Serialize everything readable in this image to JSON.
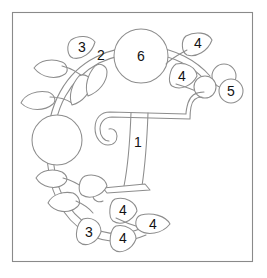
{
  "figure": {
    "background_color": "#ffffff",
    "line_color": "#8d8d8d",
    "label_color": "#121212",
    "frame": {
      "name": "diagram-border",
      "x": 12,
      "y": 12,
      "width": 241,
      "height": 250,
      "stroke_color": "#8a8a8a"
    },
    "callouts": [
      {
        "id": "callout-1",
        "label": "1",
        "x": 138,
        "y": 143,
        "target": "central-scroll-stem"
      },
      {
        "id": "callout-2",
        "label": "2",
        "x": 101,
        "y": 56,
        "target": "upper-vine-stem"
      },
      {
        "id": "callout-3-top",
        "label": "3",
        "x": 82,
        "y": 52,
        "target": "upper-left-leaf"
      },
      {
        "id": "callout-4-top-right",
        "label": "4",
        "x": 198,
        "y": 47,
        "target": "upper-right-leaf"
      },
      {
        "id": "callout-4-mid-right",
        "label": "4",
        "x": 181,
        "y": 78,
        "target": "right-leaf"
      },
      {
        "id": "callout-5",
        "label": "5",
        "x": 231,
        "y": 91,
        "target": "berry"
      },
      {
        "id": "callout-6",
        "label": "6",
        "x": 141,
        "y": 56,
        "target": "large-flower-head"
      },
      {
        "id": "callout-4-bottom-upper",
        "label": "4",
        "x": 124,
        "y": 212,
        "target": "lower-leaf-upper"
      },
      {
        "id": "callout-4-bottom-right",
        "label": "4",
        "x": 153,
        "y": 226,
        "target": "lower-leaf-right"
      },
      {
        "id": "callout-4-bottom-lower",
        "label": "4",
        "x": 124,
        "y": 239,
        "target": "lower-leaf-lower"
      },
      {
        "id": "callout-3-bottom",
        "label": "3",
        "x": 89,
        "y": 234,
        "target": "lower-left-leaf"
      }
    ],
    "parts": [
      {
        "name": "large-flower-head",
        "shape": "circle",
        "cx": 141,
        "cy": 56,
        "r": 27
      },
      {
        "name": "left-flower-head",
        "shape": "circle",
        "cx": 57,
        "cy": 140,
        "r": 25
      },
      {
        "name": "berry-upper",
        "shape": "circle",
        "cx": 224,
        "cy": 76,
        "r": 12
      },
      {
        "name": "berry-middle",
        "shape": "circle",
        "cx": 205,
        "cy": 87,
        "r": 11
      },
      {
        "name": "berry-lower",
        "shape": "circle",
        "cx": 231,
        "cy": 91,
        "r": 12
      }
    ]
  }
}
